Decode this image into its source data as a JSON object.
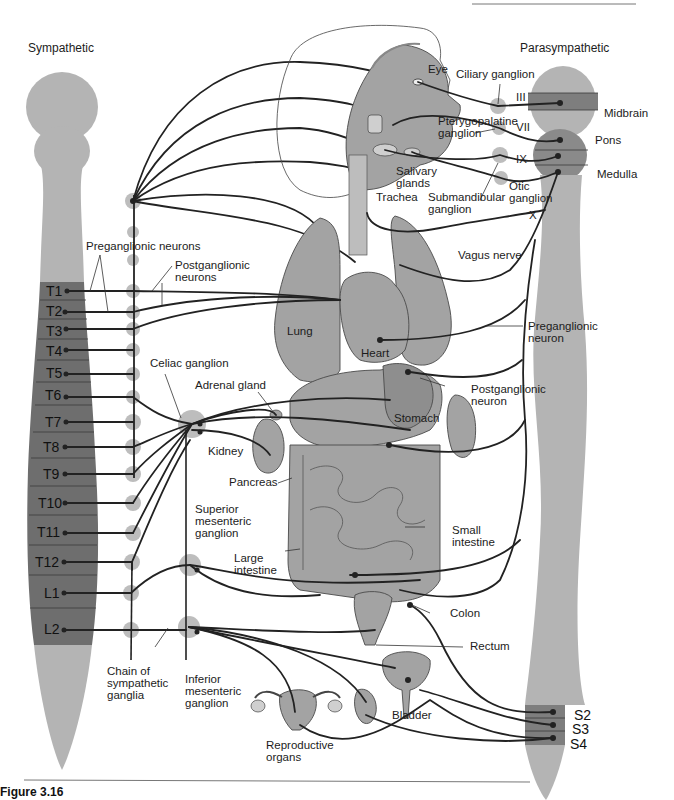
{
  "titles": {
    "sympathetic": "Sympathetic",
    "parasympathetic": "Parasympathetic"
  },
  "sympathetic_segments": [
    "T1",
    "T2",
    "T3",
    "T4",
    "T5",
    "T6",
    "T7",
    "T8",
    "T9",
    "T10",
    "T11",
    "T12",
    "L1",
    "L2"
  ],
  "parasympathetic": {
    "brain_regions": [
      "Midbrain",
      "Pons",
      "Medulla"
    ],
    "cranial_nerves": [
      "III",
      "VII",
      "IX",
      "X"
    ],
    "sacral_segments": [
      "S2",
      "S3",
      "S4"
    ]
  },
  "labels": {
    "eye": "Eye",
    "ciliary_ganglion": "Ciliary ganglion",
    "pterygopalatine_ganglion_1": "Pterygopalatine",
    "pterygopalatine_ganglion_2": "ganglion",
    "salivary_glands_1": "Salivary",
    "salivary_glands_2": "glands",
    "submandibular_ganglion_1": "Submandibular",
    "submandibular_ganglion_2": "ganglion",
    "otic_ganglion_1": "Otic",
    "otic_ganglion_2": "ganglion",
    "trachea": "Trachea",
    "vagus_nerve": "Vagus nerve",
    "preganglionic_neurons": "Preganglionic neurons",
    "postganglionic_neurons_1": "Postganglionic",
    "postganglionic_neurons_2": "neurons",
    "lung": "Lung",
    "heart": "Heart",
    "preganglionic_neuron_1": "Preganglionic",
    "preganglionic_neuron_2": "neuron",
    "postganglionic_neuron_1": "Postganglionic",
    "postganglionic_neuron_2": "neuron",
    "celiac_ganglion": "Celiac ganglion",
    "adrenal_gland": "Adrenal gland",
    "stomach": "Stomach",
    "kidney": "Kidney",
    "pancreas": "Pancreas",
    "superior_mesenteric_1": "Superior",
    "superior_mesenteric_2": "mesenteric",
    "superior_mesenteric_3": "ganglion",
    "small_intestine_1": "Small",
    "small_intestine_2": "intestine",
    "large_intestine_1": "Large",
    "large_intestine_2": "intestine",
    "colon": "Colon",
    "rectum": "Rectum",
    "chain_1": "Chain of",
    "chain_2": "sympathetic",
    "chain_3": "ganglia",
    "inferior_mesenteric_1": "Inferior",
    "inferior_mesenteric_2": "mesenteric",
    "inferior_mesenteric_3": "ganglion",
    "bladder": "Bladder",
    "reproductive_1": "Reproductive",
    "reproductive_2": "organs"
  },
  "caption": "Figure 3.16"
}
